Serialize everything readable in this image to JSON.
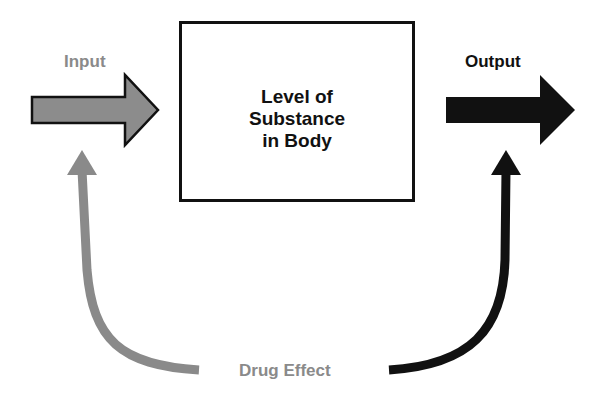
{
  "diagram": {
    "input_label": "Input",
    "output_label": "Output",
    "box": {
      "line1": "Level of",
      "line2": "Substance",
      "line3": "in Body"
    },
    "feedback_label": "Drug Effect",
    "colors": {
      "input": "#8a8a8a",
      "output": "#111111",
      "box_border": "#111111",
      "feedback_label": "#8a8a8a"
    }
  }
}
